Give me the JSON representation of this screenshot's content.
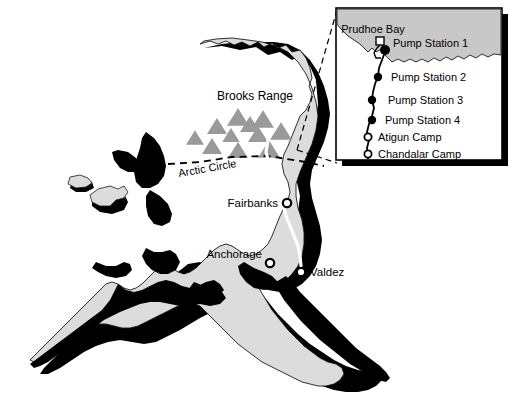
{
  "figure": {
    "name": "alaska-trans-alaska-pipeline-map",
    "background_color": "#ffffff",
    "land_color": "#dcdcdc",
    "ocean_inset_color": "#c8c8c8",
    "shadow_color": "#000000",
    "outline_color": "#1a1a1a",
    "mountain_color": "#9a9a9a",
    "pipeline_color": "#ffffff",
    "inset_fill": "#ffffff"
  },
  "main_map": {
    "region_label": "Brooks Range",
    "latitude_line_label": "Arctic Circle",
    "cities": [
      {
        "name": "Fairbanks",
        "label": "Fairbanks",
        "marker": "hollow-circle",
        "x": 287,
        "y": 203,
        "label_x": 278,
        "label_y": 207,
        "anchor": "end"
      },
      {
        "name": "Anchorage",
        "label": "Anchorage",
        "marker": "hollow-circle",
        "x": 270,
        "y": 263,
        "label_x": 261,
        "label_y": 258,
        "anchor": "end"
      },
      {
        "name": "Valdez",
        "label": "Valdez",
        "marker": "hollow-circle",
        "x": 301,
        "y": 272,
        "label_x": 310,
        "label_y": 276,
        "anchor": "start"
      }
    ]
  },
  "inset_map": {
    "title_label": "Prudhoe Bay",
    "stations": [
      {
        "label": "Prudhoe Bay",
        "marker": "small-square",
        "x": 380,
        "y": 41,
        "label_x": 373,
        "label_y": 30,
        "anchor": "middle"
      },
      {
        "label": "Pump Station 1",
        "marker": "filled-circle",
        "x": 385,
        "y": 50,
        "label_x": 393,
        "label_y": 49,
        "anchor": "start"
      },
      {
        "label": "Pump Station 2",
        "marker": "filled-circle",
        "x": 378,
        "y": 75,
        "label_x": 391,
        "label_y": 78,
        "anchor": "start"
      },
      {
        "label": "Pump Station 3",
        "marker": "filled-circle",
        "x": 372,
        "y": 99,
        "label_x": 388,
        "label_y": 101,
        "anchor": "start"
      },
      {
        "label": "Pump Station 4",
        "marker": "filled-circle",
        "x": 372,
        "y": 119,
        "label_x": 385,
        "label_y": 121,
        "anchor": "start"
      },
      {
        "label": "Atigun Camp",
        "marker": "hollow-circle",
        "x": 368,
        "y": 136,
        "label_x": 378,
        "label_y": 139,
        "anchor": "start"
      },
      {
        "label": "Chandalar Camp",
        "marker": "hollow-circle",
        "x": 368,
        "y": 153,
        "label_x": 378,
        "label_y": 156,
        "anchor": "start"
      }
    ]
  }
}
